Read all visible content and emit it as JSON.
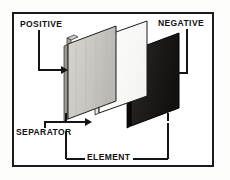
{
  "figure": {
    "frame": {
      "border_color": "#1b1b1b",
      "background_color": "#ffffff"
    }
  },
  "callouts": [
    {
      "key": "positive",
      "label": "POSITIVE",
      "position": "top-left",
      "leader": "down-then-right-arrow",
      "points_to": "positive-plate"
    },
    {
      "key": "negative",
      "label": "NEGATIVE",
      "position": "top-right",
      "leader": "down-then-left-arrow",
      "points_to": "negative-plate"
    },
    {
      "key": "separator",
      "label": "SEPARATOR",
      "position": "bottom-left",
      "leader": "up-then-right-arrow",
      "points_to": "separator-plate"
    },
    {
      "key": "element",
      "label": "ELEMENT",
      "position": "bottom-center",
      "leader": "bracket-span",
      "points_to": "whole-assembly"
    }
  ],
  "parts": [
    {
      "key": "positive-plate",
      "name": "Positive plate",
      "fill_color": "#cbc9c4",
      "edge_color": "#6f6d69",
      "outline_color": "#1b1b1b",
      "has_lug": true
    },
    {
      "key": "separator-plate",
      "name": "Separator",
      "fill_color": "#ffffff",
      "edge_color": "#d9d9d9",
      "outline_color": "#1b1b1b",
      "has_lug": false
    },
    {
      "key": "negative-plate",
      "name": "Negative plate",
      "fill_color": "#211f1e",
      "edge_color": "#0b0a0a",
      "outline_color": "#000000",
      "has_lug": true
    }
  ],
  "colors": {
    "ink": "#141414",
    "frame": "#1b1b1b",
    "positive_fill": "#cbc9c4",
    "separator_fill": "#ffffff",
    "negative_fill": "#211f1e",
    "paper": "#ffffff"
  }
}
